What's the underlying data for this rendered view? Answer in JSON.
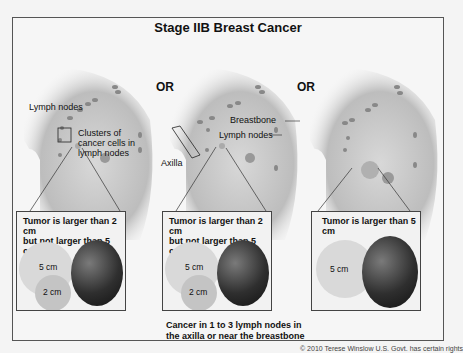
{
  "title": "Stage IIB Breast Cancer",
  "separator": "OR",
  "panels": [
    {
      "labels": {
        "lymph_nodes": "Lymph nodes",
        "clusters": [
          "Clusters of",
          "cancer cells in",
          "lymph nodes"
        ]
      },
      "box": {
        "caption": [
          "Tumor is larger than 2 cm",
          "but not larger than 5 cm"
        ],
        "circles": [
          "5 cm",
          "2 cm"
        ]
      }
    },
    {
      "labels": {
        "breastbone": "Breastbone",
        "lymph_nodes": "Lymph nodes",
        "axilla": "Axilla"
      },
      "box": {
        "caption": [
          "Tumor is larger than 2 cm",
          "but not larger than 5 cm"
        ],
        "circles": [
          "5 cm",
          "2 cm"
        ]
      },
      "footnote": [
        "Cancer in 1 to 3 lymph nodes in",
        "the axilla or near the breastbone"
      ]
    },
    {
      "box": {
        "caption": [
          "Tumor is larger than 5 cm"
        ],
        "circles": [
          "5 cm"
        ]
      }
    }
  ],
  "copyright": "© 2010 Terese Winslow U.S. Govt. has certain rights",
  "colors": {
    "circle_5cm": "#d9d9d9",
    "circle_2cm": "#c4c4c4",
    "tumor": "#2a2a2a",
    "frame": "#555555"
  }
}
